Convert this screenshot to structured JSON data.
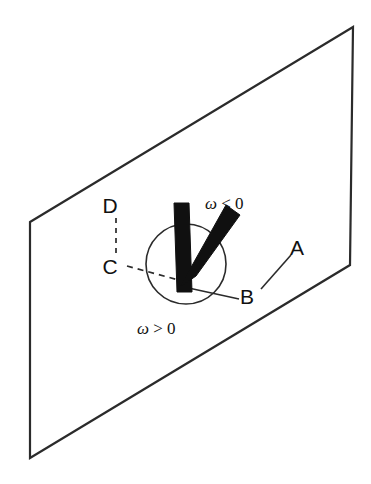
{
  "figure": {
    "type": "technical-line-diagram",
    "colors": {
      "line": "#2b2b2b",
      "fill_shape": "#101010",
      "background": "#ffffff",
      "text": "#111111"
    },
    "plane": {
      "name": "plane-parallelogram",
      "points": "30,222 353,27 350,265 30,458",
      "stroke_width": 2.2
    },
    "circle": {
      "name": "rotation-circle",
      "cx": 186,
      "cy": 264,
      "r": 40,
      "stroke_width": 1.6
    },
    "vee": {
      "name": "thick-vee-marker",
      "vertical_arm": "174,203 189,203 192,292 177,292",
      "diagonal_arm": "180,287 196,276 240,215 226,205"
    },
    "leader_lines": {
      "vertex_to_b": "185,288 243,300",
      "b_to_a": "262,288 292,256",
      "c_dash_horizontal": "128,267 186,281",
      "d_to_c_dash": "116,216 116,252"
    },
    "labels": [
      {
        "id": "D",
        "name": "label-d",
        "text": "D",
        "x": 110,
        "y": 213
      },
      {
        "id": "C",
        "name": "label-c",
        "text": "C",
        "x": 110,
        "y": 274
      },
      {
        "id": "A",
        "name": "label-a",
        "text": "A",
        "x": 291,
        "y": 255
      },
      {
        "id": "B",
        "name": "label-b",
        "text": "B",
        "x": 241,
        "y": 304
      }
    ],
    "omega_labels": [
      {
        "id": "omega-negative",
        "name": "label-omega-negative",
        "symbol": "ω",
        "relation": " < 0",
        "x": 205,
        "y": 208
      },
      {
        "id": "omega-positive",
        "name": "label-omega-positive",
        "symbol": "ω",
        "relation": " > 0",
        "x": 137,
        "y": 334
      }
    ]
  }
}
